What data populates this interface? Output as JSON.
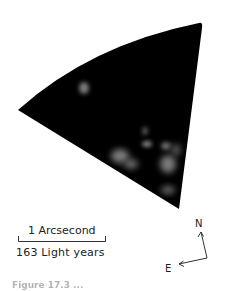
{
  "figure": {
    "image_description": "Dark wedge-shaped astronomical image with faint diffuse bright patches",
    "background_color": "#000000",
    "patch_color": "#8a8a8a"
  },
  "scale_bar": {
    "angular_label": "1 Arcsecond",
    "distance_label": "163 Light years"
  },
  "compass": {
    "north_label": "N",
    "east_label": "E"
  },
  "caption": {
    "text": "Figure 17.3 ..."
  }
}
